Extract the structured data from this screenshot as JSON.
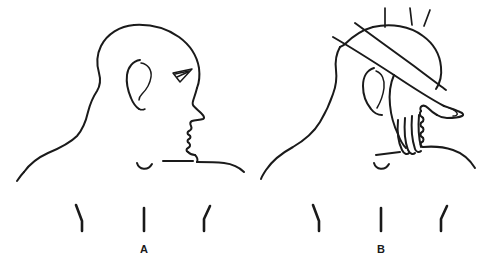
{
  "figure": {
    "type": "anatomical-line-illustration",
    "background_color": "#ffffff",
    "line_color": "#1a1a1a",
    "width": 499,
    "height": 267,
    "panels": [
      {
        "id": "A",
        "label": "A",
        "caption_text": "A",
        "description": "Lateral-oblique view of head, neck and upper chest showing surface landmarks",
        "label_x": 144,
        "label_y": 253,
        "elements": [
          "head-profile",
          "ear",
          "eye",
          "nose",
          "lips",
          "chin",
          "neck",
          "trapezius-slope",
          "left-shoulder",
          "right-shoulder",
          "suprasternal-notch",
          "landmark-tick-left",
          "landmark-tick-center",
          "landmark-tick-right"
        ]
      },
      {
        "id": "B",
        "label": "B",
        "caption_text": "B",
        "description": "Same view with examiner hand palpating the anterior neck; fingers curled over the thyroid region",
        "label_x": 381,
        "label_y": 253,
        "elements": [
          "head-profile",
          "ear",
          "neck",
          "trapezius-slope",
          "left-shoulder",
          "right-shoulder",
          "suprasternal-notch",
          "examiner-forearm",
          "examiner-hand",
          "examiner-thumb",
          "examiner-fingers",
          "landmark-tick-left",
          "landmark-tick-center",
          "landmark-tick-right"
        ]
      }
    ]
  }
}
